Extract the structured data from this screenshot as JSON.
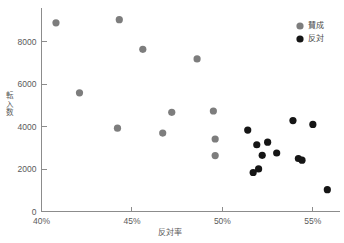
{
  "chart_data": {
    "type": "scatter",
    "title": "",
    "xlabel": "反対率",
    "ylabel": "転入数",
    "xlim": [
      40,
      56.5
    ],
    "ylim": [
      0,
      9600
    ],
    "grid": false,
    "legend_position": "top-right",
    "xticks": [
      "40%",
      "45%",
      "50%",
      "55%"
    ],
    "xtick_values": [
      40,
      45,
      50,
      55
    ],
    "yticks": [
      "0",
      "2000",
      "4000",
      "6000",
      "8000"
    ],
    "ytick_values": [
      0,
      2000,
      4000,
      6000,
      8000
    ],
    "series": [
      {
        "name": "賛成",
        "color": "#7d7d7d",
        "points": [
          {
            "x": 40.8,
            "y": 8900
          },
          {
            "x": 42.1,
            "y": 5600
          },
          {
            "x": 44.3,
            "y": 9050
          },
          {
            "x": 44.2,
            "y": 3930
          },
          {
            "x": 45.6,
            "y": 7650
          },
          {
            "x": 46.7,
            "y": 3700
          },
          {
            "x": 47.2,
            "y": 4680
          },
          {
            "x": 48.6,
            "y": 7200
          },
          {
            "x": 49.5,
            "y": 4740
          },
          {
            "x": 49.6,
            "y": 3420
          },
          {
            "x": 49.6,
            "y": 2640
          }
        ]
      },
      {
        "name": "反対",
        "color": "#151515",
        "points": [
          {
            "x": 51.4,
            "y": 3840
          },
          {
            "x": 51.7,
            "y": 1840
          },
          {
            "x": 52.0,
            "y": 2010
          },
          {
            "x": 51.9,
            "y": 3150
          },
          {
            "x": 52.2,
            "y": 2650
          },
          {
            "x": 52.5,
            "y": 3270
          },
          {
            "x": 53.0,
            "y": 2760
          },
          {
            "x": 53.9,
            "y": 4290
          },
          {
            "x": 54.2,
            "y": 2500
          },
          {
            "x": 54.4,
            "y": 2420
          },
          {
            "x": 55.0,
            "y": 4110
          },
          {
            "x": 55.8,
            "y": 1030
          }
        ]
      }
    ]
  },
  "legend": {
    "items": [
      {
        "label": "賛成",
        "color": "#7d7d7d"
      },
      {
        "label": "反対",
        "color": "#151515"
      }
    ]
  },
  "axes": {
    "x_title": "反対率",
    "y_title_chars": [
      "転",
      "入",
      "数"
    ]
  },
  "footnote": {
    "text": ""
  }
}
